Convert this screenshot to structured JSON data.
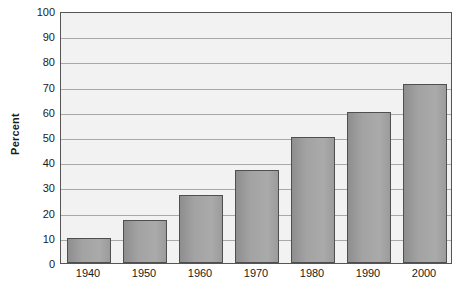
{
  "chart_data": {
    "type": "bar",
    "title": "",
    "subtitle": "",
    "xlabel": "",
    "ylabel": "Percent",
    "categories": [
      "1940",
      "1950",
      "1960",
      "1970",
      "1980",
      "1990",
      "2000"
    ],
    "values": [
      10,
      17,
      27,
      37,
      50,
      60,
      71
    ],
    "ylim": [
      0,
      100
    ],
    "ytick_labels": [
      "0",
      "10",
      "20",
      "30",
      "40",
      "50",
      "60",
      "70",
      "80",
      "90",
      "100"
    ],
    "ytick_values": [
      0,
      10,
      20,
      30,
      40,
      50,
      60,
      70,
      80,
      90,
      100
    ],
    "grid": true,
    "grid_axis": "y",
    "legend": false,
    "legend_position": "none",
    "bar_color": "#a3a3a3",
    "bar_border_color": "#4f4f4f",
    "plot_background": "#f2f2f2",
    "gridline_color": "#a8a8a8",
    "axis_color": "#555555",
    "text_color": "#1a1a1a"
  }
}
